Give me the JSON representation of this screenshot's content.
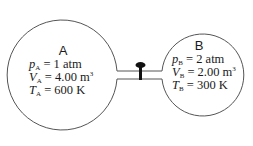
{
  "diagram": {
    "type": "two-tank gas system connected by a valved pipe",
    "colors": {
      "stroke": "#555555",
      "valve": "#111111",
      "text": "#1a1a1a",
      "background": "#ffffff"
    },
    "tank_a": {
      "label": "A",
      "pressure": {
        "symbol": "p",
        "sub": "A",
        "eq": " = 1 atm"
      },
      "volume": {
        "symbol": "V",
        "sub": "A",
        "eq": " = 4.00 m",
        "sup": "3"
      },
      "temperature": {
        "symbol": "T",
        "sub": "A",
        "eq": " = 600 K"
      }
    },
    "tank_b": {
      "label": "B",
      "pressure": {
        "symbol": "p",
        "sub": "B",
        "eq": " = 2 atm"
      },
      "volume": {
        "symbol": "V",
        "sub": "B",
        "eq": " = 2.00 m",
        "sup": "3"
      },
      "temperature": {
        "symbol": "T",
        "sub": "B",
        "eq": " = 300 K"
      }
    },
    "valve": {
      "state": "closed"
    }
  }
}
